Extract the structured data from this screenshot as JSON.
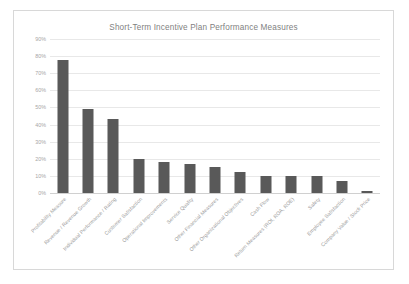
{
  "card": {
    "title": "Short-Term Incentive Plan Performance Measures"
  },
  "chart_data": {
    "type": "bar",
    "title": "Short-Term Incentive Plan Performance Measures",
    "xlabel": "",
    "ylabel": "",
    "ylim": [
      0,
      90
    ],
    "ytick_labels": [
      "90%",
      "80%",
      "70%",
      "60%",
      "50%",
      "40%",
      "30%",
      "20%",
      "10%",
      "0%"
    ],
    "ytick_values": [
      90,
      80,
      70,
      60,
      50,
      40,
      30,
      20,
      10,
      0
    ],
    "grid": true,
    "legend": "none",
    "bar_color": "#595959",
    "categories": [
      "Profitability Measure",
      "Revenue / Revenue Growth",
      "Individual Performance / Rating",
      "Customer Satisfaction",
      "Operational Improvements",
      "Service Quality",
      "Other Financial Measures",
      "Other Organizational Objectives",
      "Cash Flow",
      "Return Measures (ROI, ROA, ROE)",
      "Safety",
      "Employee Satisfaction",
      "Company Value / Stock Price"
    ],
    "values": [
      78,
      49,
      43,
      20,
      18,
      17,
      15,
      12,
      10,
      10,
      10,
      7,
      1
    ]
  }
}
